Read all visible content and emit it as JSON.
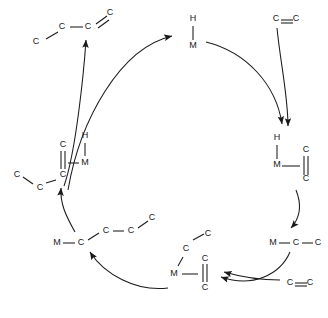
{
  "diagram": {
    "type": "reaction-cycle",
    "atom_labels": {
      "carbon": "C",
      "hydrogen": "H",
      "metal": "M"
    },
    "colors": {
      "stroke": "#1a1a1a",
      "background": "#ffffff"
    },
    "nodes": [
      {
        "id": "product-alkene",
        "name": "product-branched-alkene",
        "position": "top-left",
        "atoms": [
          {
            "label": "C",
            "x": 36,
            "y": 42
          },
          {
            "label": "C",
            "x": 62,
            "y": 27
          },
          {
            "label": "C",
            "x": 88,
            "y": 27
          },
          {
            "label": "C",
            "x": 110,
            "y": 12
          }
        ]
      },
      {
        "id": "metal-hydride",
        "name": "metal-hydride",
        "position": "top-center",
        "atoms": [
          {
            "label": "H",
            "x": 188,
            "y": 18
          },
          {
            "label": "M",
            "x": 188,
            "y": 45
          }
        ]
      },
      {
        "id": "ethylene-in-top",
        "name": "ethylene-reactant-top",
        "position": "top-right",
        "atoms": [
          {
            "label": "C",
            "x": 272,
            "y": 17
          },
          {
            "label": "C",
            "x": 297,
            "y": 17
          }
        ]
      },
      {
        "id": "hydride-olefin-complex",
        "name": "metal-hydride-ethylene-complex",
        "position": "right",
        "atoms": [
          {
            "label": "H",
            "x": 272,
            "y": 137
          },
          {
            "label": "M",
            "x": 272,
            "y": 163
          },
          {
            "label": "C",
            "x": 301,
            "y": 148
          },
          {
            "label": "C",
            "x": 301,
            "y": 178
          }
        ]
      },
      {
        "id": "metal-ethyl",
        "name": "metal-ethyl-alkyl",
        "position": "lower-right",
        "atoms": [
          {
            "label": "M",
            "x": 268,
            "y": 240
          },
          {
            "label": "C",
            "x": 292,
            "y": 240
          },
          {
            "label": "C",
            "x": 314,
            "y": 240
          }
        ]
      },
      {
        "id": "ethylene-in-bottom",
        "name": "ethylene-reactant-bottom",
        "position": "bottom-right",
        "atoms": [
          {
            "label": "C",
            "x": 286,
            "y": 280
          },
          {
            "label": "C",
            "x": 311,
            "y": 280
          }
        ]
      },
      {
        "id": "alkyl-olefin-complex",
        "name": "metal-alkyl-ethylene-complex",
        "position": "bottom-center",
        "atoms": [
          {
            "label": "C",
            "x": 206,
            "y": 234
          },
          {
            "label": "C",
            "x": 184,
            "y": 248
          },
          {
            "label": "M",
            "x": 172,
            "y": 271
          },
          {
            "label": "C",
            "x": 200,
            "y": 256
          },
          {
            "label": "C",
            "x": 200,
            "y": 285
          }
        ]
      },
      {
        "id": "metal-butyl",
        "name": "metal-alkyl-chain",
        "position": "lower-left",
        "atoms": [
          {
            "label": "M",
            "x": 53,
            "y": 240
          },
          {
            "label": "C",
            "x": 79,
            "y": 240
          },
          {
            "label": "C",
            "x": 104,
            "y": 228
          },
          {
            "label": "C",
            "x": 129,
            "y": 228
          },
          {
            "label": "C",
            "x": 150,
            "y": 217
          }
        ]
      },
      {
        "id": "beta-hydride-complex",
        "name": "beta-hydride-elimination-complex",
        "position": "left",
        "atoms": [
          {
            "label": "C",
            "x": 58,
            "y": 143
          },
          {
            "label": "H",
            "x": 80,
            "y": 135
          },
          {
            "label": "M",
            "x": 80,
            "y": 160
          },
          {
            "label": "C",
            "x": 58,
            "y": 173
          },
          {
            "label": "C",
            "x": 36,
            "y": 186
          },
          {
            "label": "C",
            "x": 13,
            "y": 173
          }
        ]
      }
    ],
    "arrows": [
      {
        "name": "arrow-to-metal-hydride",
        "from": "beta-hydride-complex",
        "to": "metal-hydride"
      },
      {
        "name": "arrow-product-release",
        "from": "beta-hydride-complex",
        "to": "product-alkene"
      },
      {
        "name": "arrow-ethylene-coordination-top",
        "from": "ethylene-in-top",
        "to": "hydride-olefin-complex"
      },
      {
        "name": "arrow-metal-hydride-to-complex",
        "from": "metal-hydride",
        "to": "hydride-olefin-complex"
      },
      {
        "name": "arrow-insertion-to-ethyl",
        "from": "hydride-olefin-complex",
        "to": "metal-ethyl"
      },
      {
        "name": "arrow-ethylene-coordination-bottom",
        "from": "ethylene-in-bottom",
        "to": "alkyl-olefin-complex"
      },
      {
        "name": "arrow-ethyl-to-complex",
        "from": "metal-ethyl",
        "to": "alkyl-olefin-complex"
      },
      {
        "name": "arrow-chain-growth",
        "from": "alkyl-olefin-complex",
        "to": "metal-butyl"
      },
      {
        "name": "arrow-beta-hydride-elimination",
        "from": "metal-butyl",
        "to": "beta-hydride-complex"
      }
    ]
  }
}
